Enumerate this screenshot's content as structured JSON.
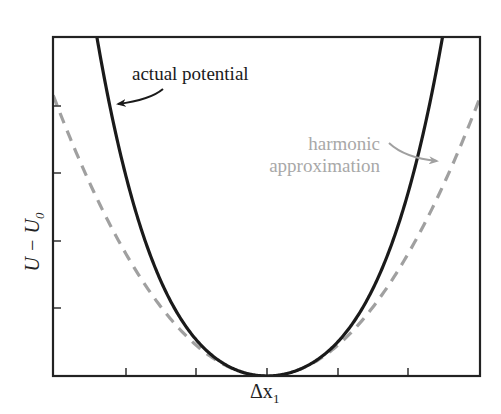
{
  "chart_data": {
    "type": "line",
    "title": "",
    "xlabel": "Δx₁",
    "ylabel": "U − U₀",
    "xlabel_parts": {
      "main": "Δx",
      "sub": "1"
    },
    "ylabel_parts": {
      "main": "U − U",
      "sub": "0"
    },
    "x_ticks": 5,
    "y_ticks": 4,
    "tick_labels_shown": false,
    "grid": false,
    "series": [
      {
        "name": "actual potential",
        "style": "solid",
        "color": "#1a1a1a",
        "shape": "anharmonic well, steeper on left",
        "points_px": [
          [
            95,
            37
          ],
          [
            133,
            215
          ],
          [
            180,
            320
          ],
          [
            230,
            366
          ],
          [
            267,
            376
          ],
          [
            300,
            370
          ],
          [
            353,
            320
          ],
          [
            398,
            220
          ],
          [
            434,
            37
          ]
        ]
      },
      {
        "name": "harmonic approximation",
        "style": "dashed",
        "color": "#a0a0a0",
        "shape": "parabola",
        "points_px": [
          [
            57,
            105
          ],
          [
            120,
            243
          ],
          [
            200,
            348
          ],
          [
            267,
            376
          ],
          [
            334,
            348
          ],
          [
            414,
            243
          ],
          [
            476,
            102
          ]
        ]
      }
    ],
    "annotations": [
      {
        "text": "actual potential",
        "color": "#1a1a1a",
        "arrow_to": "left branch of actual potential"
      },
      {
        "text_lines": [
          "harmonic",
          "approximation"
        ],
        "color": "#a8a8a8",
        "arrow_to": "right branch of harmonic approximation"
      }
    ]
  },
  "labels": {
    "actual": "actual potential",
    "harmonic_line1": "harmonic",
    "harmonic_line2": "approximation",
    "x_main": "Δx",
    "x_sub": "1",
    "y_main": "U − U",
    "y_sub": "0"
  },
  "colors": {
    "frame": "#222222",
    "actual": "#1a1a1a",
    "harmonic": "#a0a0a0",
    "harmonic_text": "#a8a8a8"
  }
}
